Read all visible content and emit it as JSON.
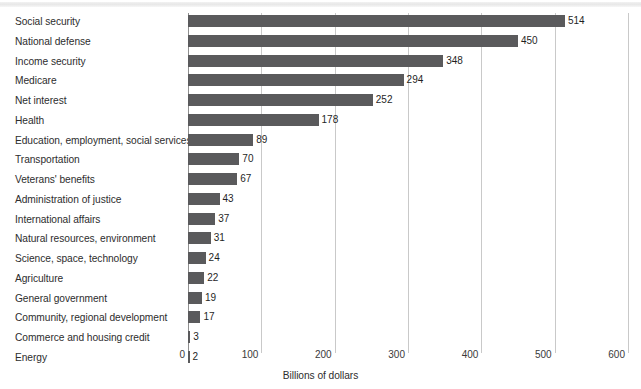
{
  "chart_data": {
    "type": "bar",
    "orientation": "horizontal",
    "title": "",
    "xlabel": "Billions of dollars",
    "ylabel": "",
    "xlim": [
      0,
      600
    ],
    "xticks": [
      0,
      100,
      200,
      300,
      400,
      500,
      600
    ],
    "xtick_labels": [
      "0",
      "100",
      "200",
      "300",
      "400",
      "500",
      "600"
    ],
    "grid": "vertical",
    "legend": "none",
    "bar_color": "#5a5a5c",
    "gridline_color": "#c9c9c9",
    "axis_color": "#8f8f8f",
    "categories": [
      "Social security",
      "National defense",
      "Income security",
      "Medicare",
      "Net interest",
      "Health",
      "Education, employment, social services",
      "Transportation",
      "Veterans' benefits",
      "Administration of justice",
      "International affairs",
      "Natural resources, environment",
      "Science, space, technology",
      "Agriculture",
      "General government",
      "Community, regional development",
      "Commerce and housing credit",
      "Energy"
    ],
    "values": [
      514,
      450,
      348,
      294,
      252,
      178,
      89,
      70,
      67,
      43,
      37,
      31,
      24,
      22,
      19,
      17,
      3,
      2
    ],
    "value_labels": [
      "514",
      "450",
      "348",
      "294",
      "252",
      "178",
      "89",
      "70",
      "67",
      "43",
      "37",
      "31",
      "24",
      "22",
      "19",
      "17",
      "3",
      "2"
    ]
  }
}
